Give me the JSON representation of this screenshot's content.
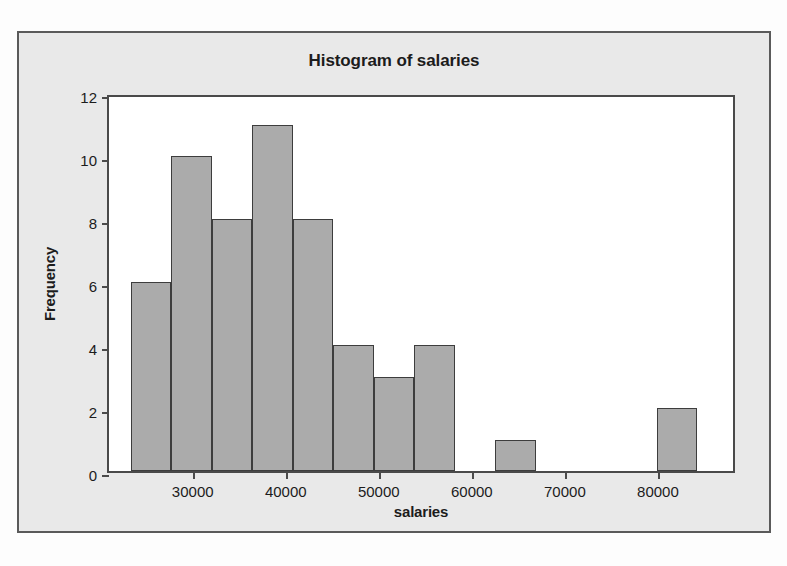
{
  "chart_data": {
    "type": "bar",
    "title": "Histogram of salaries",
    "xlabel": "salaries",
    "ylabel": "Frequency",
    "grid": false,
    "legend": null,
    "xlim": [
      21000,
      88500
    ],
    "ylim": [
      0,
      12
    ],
    "bin_width": 4350,
    "xticks": [
      30000,
      40000,
      50000,
      60000,
      70000,
      80000
    ],
    "xtick_labels": [
      "30000",
      "40000",
      "50000",
      "60000",
      "70000",
      "80000"
    ],
    "yticks": [
      0,
      2,
      4,
      6,
      8,
      10,
      12
    ],
    "ytick_labels": [
      "0",
      "2",
      "4",
      "6",
      "8",
      "10",
      "12"
    ],
    "bins": [
      {
        "left": 23350,
        "right": 27700,
        "value": 6
      },
      {
        "left": 27700,
        "right": 32050,
        "value": 10
      },
      {
        "left": 32050,
        "right": 36400,
        "value": 8
      },
      {
        "left": 36400,
        "right": 40750,
        "value": 11
      },
      {
        "left": 40750,
        "right": 45100,
        "value": 8
      },
      {
        "left": 45100,
        "right": 49450,
        "value": 4
      },
      {
        "left": 49450,
        "right": 53800,
        "value": 3
      },
      {
        "left": 53800,
        "right": 58150,
        "value": 4
      },
      {
        "left": 58150,
        "right": 62500,
        "value": 0
      },
      {
        "left": 62500,
        "right": 66850,
        "value": 1
      },
      {
        "left": 66850,
        "right": 71200,
        "value": 0
      },
      {
        "left": 71200,
        "right": 75550,
        "value": 0
      },
      {
        "left": 75550,
        "right": 79900,
        "value": 0
      },
      {
        "left": 79900,
        "right": 84250,
        "value": 2
      }
    ],
    "categories": [
      "23350-27700",
      "27700-32050",
      "32050-36400",
      "36400-40750",
      "40750-45100",
      "45100-49450",
      "49450-53800",
      "53800-58150",
      "58150-62500",
      "62500-66850",
      "66850-71200",
      "71200-75550",
      "75550-79900",
      "79900-84250"
    ],
    "values": [
      6,
      10,
      8,
      11,
      8,
      4,
      3,
      4,
      0,
      1,
      0,
      0,
      0,
      2
    ]
  },
  "colors": {
    "bar_fill": "#ababab",
    "bar_border": "#3d3d3d",
    "panel_background": "#e9e9e9",
    "plot_background": "#ffffff",
    "axis": "#4a4a4a",
    "text": "#1c1c1c"
  }
}
